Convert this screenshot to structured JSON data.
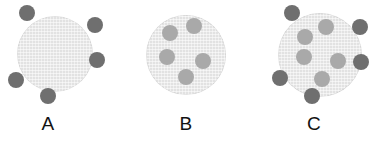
{
  "figure": {
    "background_color": "#ffffff",
    "width": 383,
    "height": 146
  },
  "colors": {
    "cell_fill": "#e2e2e2",
    "bound_particle": "#6f6f6f",
    "internal_particle": "#a9a9a9",
    "label_text": "#121212"
  },
  "legend_semantics": {
    "bound_particle_meaning": "dark particle attached to outer cell membrane",
    "internal_particle_meaning": "light particle inside the cell"
  },
  "panels": [
    {
      "id": "A",
      "label": "A",
      "label_x": 48,
      "cell": {
        "cx": 55,
        "cy": 54,
        "r": 38
      },
      "bound_count": 5,
      "internal_count": 5,
      "particles": [
        {
          "type": "bound",
          "cx": 27,
          "cy": 13,
          "r": 8
        },
        {
          "type": "bound",
          "cx": 95,
          "cy": 25,
          "r": 8
        },
        {
          "type": "bound",
          "cx": 97,
          "cy": 60,
          "r": 8
        },
        {
          "type": "bound",
          "cx": 16,
          "cy": 80,
          "r": 8
        },
        {
          "type": "bound",
          "cx": 48,
          "cy": 96,
          "r": 8
        }
      ]
    },
    {
      "id": "B",
      "label": "B",
      "label_x": 186,
      "cell": {
        "cx": 186,
        "cy": 55,
        "r": 40
      },
      "bound_count": 0,
      "internal_count": 5,
      "particles": [
        {
          "type": "internal",
          "cx": 194,
          "cy": 26,
          "r": 8
        },
        {
          "type": "internal",
          "cx": 170,
          "cy": 33,
          "r": 8
        },
        {
          "type": "internal",
          "cx": 167,
          "cy": 57,
          "r": 8
        },
        {
          "type": "internal",
          "cx": 203,
          "cy": 61,
          "r": 8
        },
        {
          "type": "internal",
          "cx": 186,
          "cy": 77,
          "r": 8
        }
      ]
    },
    {
      "id": "C",
      "label": "C",
      "label_x": 314,
      "cell": {
        "cx": 320,
        "cy": 55,
        "r": 42
      },
      "bound_count": 4,
      "internal_count": 5,
      "particles": [
        {
          "type": "bound",
          "cx": 292,
          "cy": 13,
          "r": 8
        },
        {
          "type": "bound",
          "cx": 360,
          "cy": 27,
          "r": 8
        },
        {
          "type": "bound",
          "cx": 361,
          "cy": 62,
          "r": 8
        },
        {
          "type": "bound",
          "cx": 280,
          "cy": 78,
          "r": 8
        },
        {
          "type": "bound",
          "cx": 312,
          "cy": 96,
          "r": 8
        },
        {
          "type": "internal",
          "cx": 326,
          "cy": 27,
          "r": 8
        },
        {
          "type": "internal",
          "cx": 305,
          "cy": 37,
          "r": 8
        },
        {
          "type": "internal",
          "cx": 304,
          "cy": 57,
          "r": 8
        },
        {
          "type": "internal",
          "cx": 338,
          "cy": 61,
          "r": 8
        },
        {
          "type": "internal",
          "cx": 322,
          "cy": 79,
          "r": 8
        }
      ]
    }
  ]
}
